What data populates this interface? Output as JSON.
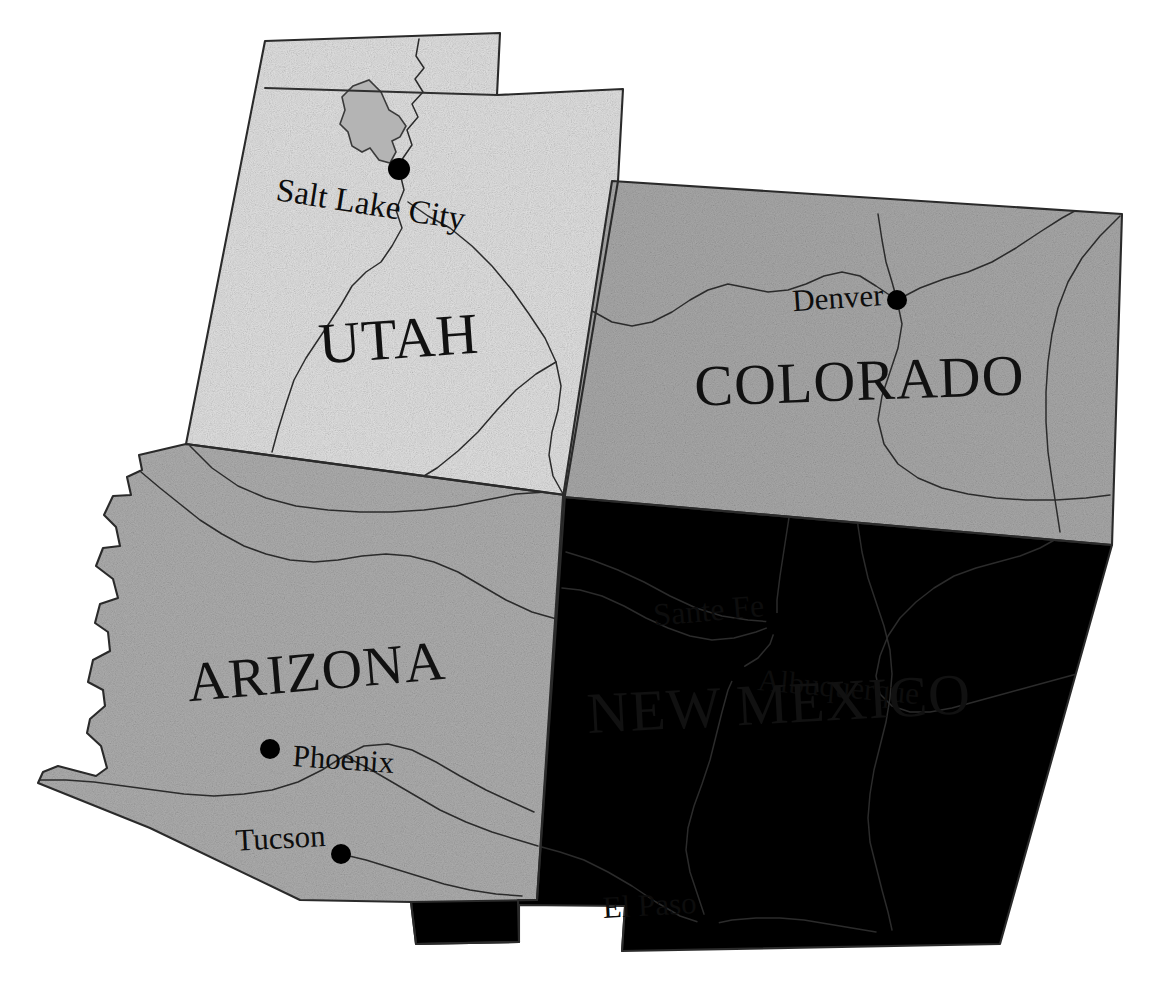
{
  "map": {
    "title": "Southwestern United States",
    "background_color": "#ffffff",
    "states": [
      {
        "id": "utah",
        "name": "UTAH",
        "fill_color": "#e2e2e2",
        "label_x": 400,
        "label_y": 358,
        "label_size": 58,
        "label_rotation": -4
      },
      {
        "id": "colorado",
        "name": "COLORADO",
        "fill_color": "#a9a9a9",
        "label_x": 860,
        "label_y": 400,
        "label_size": 58,
        "label_rotation": -2
      },
      {
        "id": "arizona",
        "name": "ARIZONA",
        "fill_color": "#aeaeae",
        "label_x": 318,
        "label_y": 690,
        "label_size": 56,
        "label_rotation": -5
      },
      {
        "id": "new-mexico",
        "name": "NEW MEXICO",
        "fill_color": "#e4e4e4",
        "label_x": 780,
        "label_y": 723,
        "label_size": 58,
        "label_rotation": -3
      }
    ],
    "cities": [
      {
        "id": "salt-lake-city",
        "name": "Salt Lake City",
        "dot_x": 399,
        "dot_y": 169,
        "label_x": 275,
        "label_y": 200,
        "label_size": 33,
        "label_rotation": 9,
        "label_anchor": "start"
      },
      {
        "id": "denver",
        "name": "Denver",
        "dot_x": 897,
        "dot_y": 300,
        "label_x": 884,
        "label_y": 305,
        "label_size": 31,
        "label_rotation": -4,
        "label_anchor": "end"
      },
      {
        "id": "sante-fe",
        "name": "Sante Fe",
        "dot_x": 777,
        "dot_y": 624,
        "label_x": 765,
        "label_y": 616,
        "label_size": 32,
        "label_rotation": -5,
        "label_anchor": "end"
      },
      {
        "id": "albuquerque",
        "name": "Albuquerque",
        "dot_x": 736,
        "dot_y": 672,
        "label_x": 757,
        "label_y": 690,
        "label_size": 31,
        "label_rotation": 5,
        "label_anchor": "start"
      },
      {
        "id": "phoenix",
        "name": "Phoenix",
        "dot_x": 270,
        "dot_y": 749,
        "label_x": 292,
        "label_y": 766,
        "label_size": 31,
        "label_rotation": 4,
        "label_anchor": "start"
      },
      {
        "id": "tucson",
        "name": "Tucson",
        "dot_x": 341,
        "dot_y": 854,
        "label_x": 326,
        "label_y": 846,
        "label_size": 31,
        "label_rotation": -3,
        "label_anchor": "end"
      },
      {
        "id": "el-paso",
        "name": "El Paso",
        "dot_x": 708,
        "dot_y": 925,
        "label_x": 697,
        "label_y": 913,
        "label_size": 31,
        "label_rotation": -3,
        "label_anchor": "end"
      }
    ],
    "water_features": [
      {
        "id": "great-salt-lake",
        "name": "Great Salt Lake",
        "fill_color": "#b4b4b4"
      }
    ],
    "legend_note": "Grayscale shaded relief map of Utah, Colorado, Arizona and New Mexico with major cities and rivers"
  }
}
